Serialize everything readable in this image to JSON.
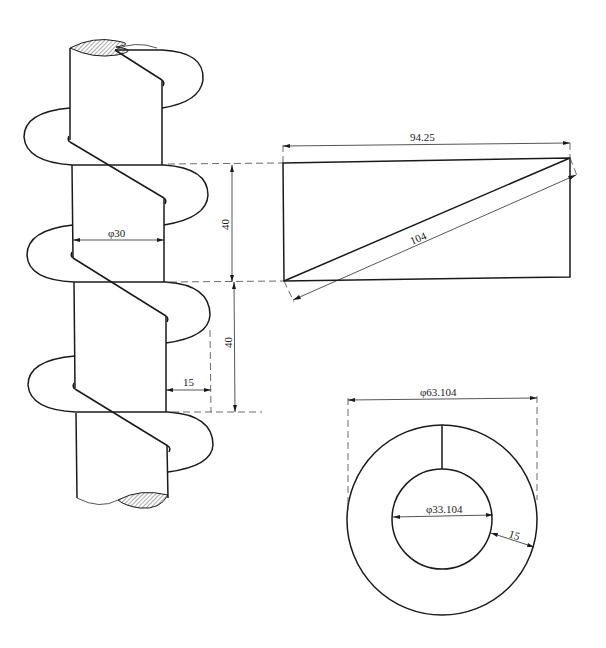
{
  "drawing": {
    "title": "Screw conveyor helical flight development",
    "views": {
      "elevation": {
        "shaft_diameter_label": "φ30",
        "pitch_label_upper": "40",
        "pitch_label_lower": "40",
        "flight_width_label": "15"
      },
      "development_triangle": {
        "circumference_label": "94.25",
        "helix_length_label": "104"
      },
      "flat_blank": {
        "outer_diameter_label": "φ63.104",
        "inner_diameter_label": "φ33.104",
        "width_label": "15"
      }
    },
    "colors": {
      "line": "#1a1a1a",
      "hatch": "#555555",
      "background": "#ffffff"
    }
  }
}
